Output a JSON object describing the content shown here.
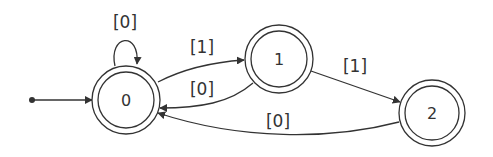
{
  "diagram": {
    "type": "state-machine",
    "nodes": [
      {
        "id": "s0",
        "label": "0",
        "accepting": true,
        "initial": true
      },
      {
        "id": "s1",
        "label": "1",
        "accepting": true
      },
      {
        "id": "s2",
        "label": "2",
        "accepting": true
      }
    ],
    "edges": [
      {
        "from": "s0",
        "to": "s0",
        "label": "[0]"
      },
      {
        "from": "s0",
        "to": "s1",
        "label": "[1]"
      },
      {
        "from": "s1",
        "to": "s0",
        "label": "[0]"
      },
      {
        "from": "s1",
        "to": "s2",
        "label": "[1]"
      },
      {
        "from": "s2",
        "to": "s0",
        "label": "[0]"
      }
    ],
    "colors": {
      "stroke": "#333333",
      "background": "#ffffff"
    }
  }
}
